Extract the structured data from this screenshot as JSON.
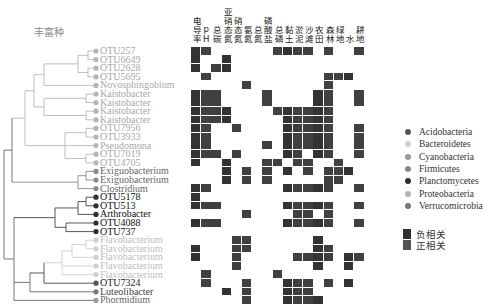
{
  "title": "丰富种",
  "columns": [
    "电导率",
    "pH",
    "总碳",
    "亚硝态氮",
    "硝态氮",
    "氨氮",
    "总氮",
    "磷酸盐",
    "总磷",
    "黏土",
    "淤泥",
    "沙滩",
    "农田",
    "森林",
    "绿地",
    "水",
    "耕地"
  ],
  "rows": [
    {
      "label": "OTU257",
      "phylum": "Proteobacteria",
      "cells": [
        0,
        1,
        8,
        9,
        10,
        11,
        13,
        16
      ]
    },
    {
      "label": "OTU6649",
      "phylum": "Proteobacteria",
      "cells": [
        0,
        3
      ]
    },
    {
      "label": "OTU2628",
      "phylum": "Proteobacteria",
      "cells": [
        0,
        2,
        3
      ]
    },
    {
      "label": "OTU5695",
      "phylum": "Proteobacteria",
      "cells": [
        1,
        13,
        14,
        15
      ]
    },
    {
      "label": "Novosphingobium",
      "phylum": "Proteobacteria",
      "cells": [
        5,
        13
      ]
    },
    {
      "label": "Kaistobacter",
      "phylum": "Proteobacteria",
      "cells": [
        0,
        1,
        2,
        7,
        12,
        13,
        16
      ]
    },
    {
      "label": "Kaistobacter",
      "phylum": "Proteobacteria",
      "cells": [
        0,
        1,
        2,
        7,
        12,
        13,
        16
      ]
    },
    {
      "label": "Kaistobacter",
      "phylum": "Proteobacteria",
      "cells": [
        0,
        1,
        2,
        3,
        8,
        9,
        10,
        11,
        12,
        13
      ]
    },
    {
      "label": "Kaistobacter",
      "phylum": "Proteobacteria",
      "cells": [
        0,
        1,
        2,
        3,
        9,
        10,
        11,
        12,
        13
      ]
    },
    {
      "label": "OTU7956",
      "phylum": "Proteobacteria",
      "cells": [
        0,
        1,
        4,
        9,
        10,
        11,
        12,
        13,
        16
      ]
    },
    {
      "label": "OTU3933",
      "phylum": "Proteobacteria",
      "cells": [
        0,
        1,
        9,
        10,
        11,
        12,
        13,
        16
      ]
    },
    {
      "label": "Pseudomona",
      "phylum": "Proteobacteria",
      "cells": [
        0,
        1,
        7,
        9,
        10,
        11,
        12,
        13,
        16
      ]
    },
    {
      "label": "OTU7019",
      "phylum": "Proteobacteria",
      "cells": [
        0,
        1,
        2,
        4,
        9,
        10,
        12,
        13,
        16
      ]
    },
    {
      "label": "OTU4705",
      "phylum": "Proteobacteria",
      "cells": [
        0,
        3,
        7,
        8,
        10,
        11,
        14
      ]
    },
    {
      "label": "Exiguobacterium",
      "phylum": "Firmicutes",
      "cells": [
        3,
        5,
        7,
        9,
        11,
        13,
        14,
        15
      ]
    },
    {
      "label": "Exiguobacterium",
      "phylum": "Firmicutes",
      "cells": [
        3,
        5,
        7,
        13,
        14
      ]
    },
    {
      "label": "Clostridium",
      "phylum": "Firmicutes",
      "cells": [
        0,
        1,
        9,
        10,
        11,
        12,
        13,
        16
      ]
    },
    {
      "label": "OTU5178",
      "phylum": "Planctomycetes",
      "cells": [
        0
      ]
    },
    {
      "label": "OTU513",
      "phylum": "Planctomycetes",
      "cells": [
        0,
        1,
        2,
        9,
        10,
        11,
        12,
        13,
        16
      ]
    },
    {
      "label": "Arthrobacter",
      "phylum": "Planctomycetes",
      "cells": [
        5,
        10,
        11,
        13
      ]
    },
    {
      "label": "OTU4088",
      "phylum": "Planctomycetes",
      "cells": [
        0,
        1,
        2,
        9,
        10,
        11,
        12,
        13,
        16
      ]
    },
    {
      "label": "OTU737",
      "phylum": "Planctomycetes",
      "cells": []
    },
    {
      "label": "Flavobacterium",
      "phylum": "Bacteroidetes",
      "cells": [
        4,
        5,
        12
      ]
    },
    {
      "label": "Flavobacterium",
      "phylum": "Bacteroidetes",
      "cells": [
        0,
        4,
        5,
        12,
        13
      ]
    },
    {
      "label": "Flavobacterium",
      "phylum": "Bacteroidetes",
      "cells": [
        0,
        4,
        10,
        11,
        12,
        13,
        15,
        16
      ]
    },
    {
      "label": "Flavobacterium",
      "phylum": "Bacteroidetes",
      "cells": [
        4,
        12,
        15
      ]
    },
    {
      "label": "Flavobacterium",
      "phylum": "Bacteroidetes",
      "cells": [
        1,
        8
      ]
    },
    {
      "label": "OTU7324",
      "phylum": "Acidobacteria",
      "cells": [
        1,
        5,
        9,
        10,
        11,
        13,
        15
      ]
    },
    {
      "label": "Luteolibacter",
      "phylum": "Verrucomicrobia",
      "cells": [
        3,
        5,
        9,
        10,
        11
      ]
    },
    {
      "label": "Phormidium",
      "phylum": "Cyanobacteria",
      "cells": [
        5,
        9,
        10,
        11,
        12
      ]
    }
  ],
  "phyla": [
    {
      "name": "Acidobacteria",
      "color": "#555555",
      "label_color": "#222222"
    },
    {
      "name": "Bacteroidetes",
      "color": "#cfcfcf",
      "label_color": "#bdbdbd"
    },
    {
      "name": "Cyanobacteria",
      "color": "#9a9a9a",
      "label_color": "#666666"
    },
    {
      "name": "Firmicutes",
      "color": "#8a8a8a",
      "label_color": "#666666"
    },
    {
      "name": "Planctomycetes",
      "color": "#2e2e2e",
      "label_color": "#111111"
    },
    {
      "name": "Proteobacteria",
      "color": "#b5b5b5",
      "label_color": "#a8a8a8"
    },
    {
      "name": "Verrucomicrobia",
      "color": "#777777",
      "label_color": "#444444"
    }
  ],
  "correlation_legend": [
    {
      "label": "负相关",
      "color": "#2f2f2f"
    },
    {
      "label": "正相关",
      "color": "#555555"
    }
  ],
  "cell_color": "#3a3a3a"
}
